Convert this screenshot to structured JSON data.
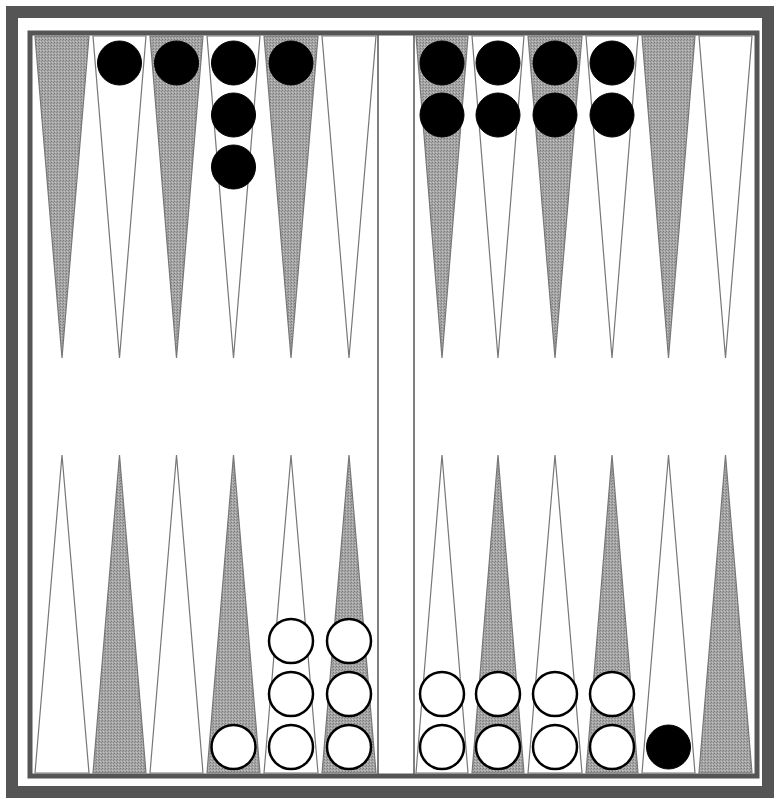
{
  "game": {
    "type": "backgammon",
    "colors": {
      "frame": "#555555",
      "dark_point": "#9a9a9a",
      "light_point": "#ffffff",
      "point_outline": "#777777",
      "black_checker": "#000000",
      "white_checker": "#ffffff",
      "white_checker_outline": "#000000"
    },
    "points_top": [
      {
        "x": 33,
        "w": 58,
        "shade": "dark",
        "checkers": 0,
        "color": ""
      },
      {
        "x": 91,
        "w": 57,
        "shade": "light",
        "checkers": 1,
        "color": "black"
      },
      {
        "x": 148,
        "w": 57,
        "shade": "dark",
        "checkers": 1,
        "color": "black"
      },
      {
        "x": 205,
        "w": 57,
        "shade": "light",
        "checkers": 3,
        "color": "black"
      },
      {
        "x": 262,
        "w": 58,
        "shade": "dark",
        "checkers": 1,
        "color": "black"
      },
      {
        "x": 320,
        "w": 58,
        "shade": "light",
        "checkers": 0,
        "color": ""
      },
      {
        "x": 414,
        "w": 56,
        "shade": "dark",
        "checkers": 2,
        "color": "black"
      },
      {
        "x": 470,
        "w": 56,
        "shade": "light",
        "checkers": 2,
        "color": "black"
      },
      {
        "x": 526,
        "w": 58,
        "shade": "dark",
        "checkers": 2,
        "color": "black"
      },
      {
        "x": 584,
        "w": 56,
        "shade": "light",
        "checkers": 2,
        "color": "black"
      },
      {
        "x": 640,
        "w": 57,
        "shade": "dark",
        "checkers": 0,
        "color": ""
      },
      {
        "x": 697,
        "w": 57,
        "shade": "light",
        "checkers": 0,
        "color": ""
      }
    ],
    "points_bottom": [
      {
        "x": 33,
        "w": 58,
        "shade": "light",
        "checkers": 0,
        "color": ""
      },
      {
        "x": 91,
        "w": 57,
        "shade": "dark",
        "checkers": 0,
        "color": ""
      },
      {
        "x": 148,
        "w": 57,
        "shade": "light",
        "checkers": 0,
        "color": ""
      },
      {
        "x": 205,
        "w": 57,
        "shade": "dark",
        "checkers": 1,
        "color": "white"
      },
      {
        "x": 262,
        "w": 58,
        "shade": "light",
        "checkers": 3,
        "color": "white"
      },
      {
        "x": 320,
        "w": 58,
        "shade": "dark",
        "checkers": 3,
        "color": "white"
      },
      {
        "x": 414,
        "w": 56,
        "shade": "light",
        "checkers": 2,
        "color": "white"
      },
      {
        "x": 470,
        "w": 56,
        "shade": "dark",
        "checkers": 2,
        "color": "white"
      },
      {
        "x": 526,
        "w": 58,
        "shade": "light",
        "checkers": 2,
        "color": "white"
      },
      {
        "x": 584,
        "w": 56,
        "shade": "dark",
        "checkers": 2,
        "color": "white"
      },
      {
        "x": 640,
        "w": 57,
        "shade": "light",
        "checkers": 1,
        "color": "black"
      },
      {
        "x": 697,
        "w": 57,
        "shade": "dark",
        "checkers": 0,
        "color": ""
      }
    ]
  }
}
